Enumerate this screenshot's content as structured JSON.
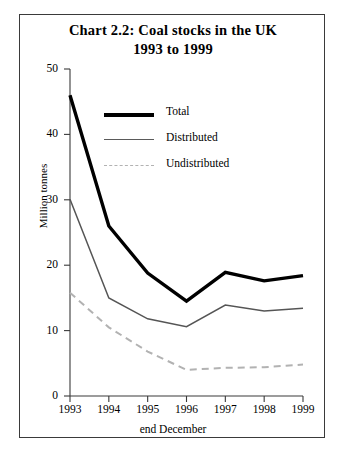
{
  "title": {
    "line1": "Chart 2.2:  Coal stocks in the UK",
    "line2": "1993 to 1999"
  },
  "legend": {
    "position": "upper-center",
    "items": [
      {
        "label": "Total",
        "color": "#000000",
        "style": "solid-thick"
      },
      {
        "label": "Distributed",
        "color": "#5a5a5a",
        "style": "solid-thin"
      },
      {
        "label": "Undistributed",
        "color": "#b2b2b2",
        "style": "dashed"
      }
    ]
  },
  "chart_data": {
    "type": "line",
    "title": "Chart 2.2:  Coal stocks in the UK 1993 to 1999",
    "xlabel": "end December",
    "ylabel": "Million tonnes",
    "categories": [
      "1993",
      "1994",
      "1995",
      "1996",
      "1997",
      "1998",
      "1999"
    ],
    "x": [
      1993,
      1994,
      1995,
      1996,
      1997,
      1998,
      1999
    ],
    "ylim": [
      0,
      50
    ],
    "yticks": [
      0,
      10,
      20,
      30,
      40,
      50
    ],
    "xticklabels": [
      "1993",
      "1994",
      "1995",
      "1996",
      "1997",
      "1998",
      "1999"
    ],
    "grid": false,
    "series": [
      {
        "name": "Total",
        "color": "#000000",
        "values": [
          46.0,
          26.0,
          18.8,
          14.5,
          18.9,
          17.6,
          18.4
        ]
      },
      {
        "name": "Distributed",
        "color": "#5a5a5a",
        "values": [
          30.1,
          15.0,
          11.8,
          10.6,
          13.9,
          13.0,
          13.4
        ]
      },
      {
        "name": "Undistributed",
        "color": "#b2b2b2",
        "values": [
          15.8,
          10.5,
          6.8,
          4.0,
          4.3,
          4.4,
          4.8
        ]
      }
    ]
  },
  "axes": {
    "y_tick_labels": [
      "50",
      "40",
      "30",
      "20",
      "10",
      "0"
    ],
    "y_axis_title": "Million tonnes",
    "x_axis_title": "end December",
    "x_tick_labels": [
      "1993",
      "1994",
      "1995",
      "1996",
      "1997",
      "1998",
      "1999"
    ]
  }
}
